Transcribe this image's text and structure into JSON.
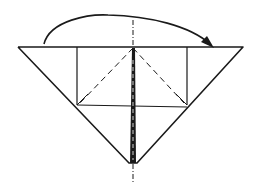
{
  "diagram": {
    "type": "origami-fold-instruction",
    "colors": {
      "line": "#1a1a1a",
      "background": "#ffffff"
    },
    "step": "fold left flap over to the right along center valley line",
    "arrow": {
      "direction": "left-to-right",
      "style": "curved-arc-with-head"
    }
  }
}
